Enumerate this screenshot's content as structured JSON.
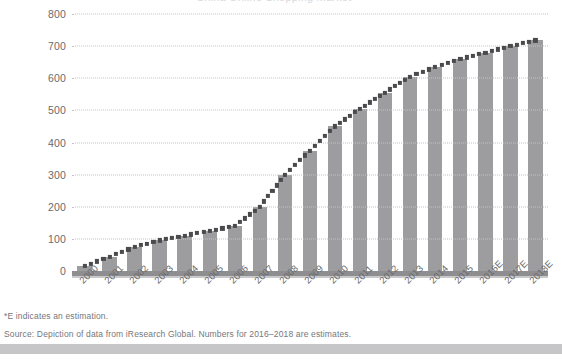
{
  "title_sliver": "China Online Shopping Market",
  "chart_data": {
    "type": "bar",
    "title": "China Online Shopping Market",
    "xlabel": "",
    "ylabel": "",
    "ylim": [
      0,
      800
    ],
    "ytick_labels": [
      "800",
      "700",
      "600",
      "500",
      "400",
      "300",
      "200",
      "100",
      "0"
    ],
    "yticks": [
      800,
      700,
      600,
      500,
      400,
      300,
      200,
      100,
      0
    ],
    "grid": true,
    "legend": "none",
    "categories": [
      "2000",
      "2001",
      "2002",
      "2003",
      "2004",
      "2005",
      "2006",
      "2007",
      "2008",
      "2009",
      "2010",
      "2011",
      "2012",
      "2013",
      "2014",
      "2015",
      "2016E",
      "2017E",
      "2018E"
    ],
    "values": [
      15,
      45,
      75,
      95,
      110,
      125,
      140,
      200,
      300,
      375,
      450,
      505,
      555,
      605,
      635,
      660,
      680,
      700,
      718
    ],
    "series": [
      {
        "name": "Market size",
        "type": "bar",
        "values": [
          15,
          45,
          75,
          95,
          110,
          125,
          140,
          200,
          300,
          375,
          450,
          505,
          555,
          605,
          635,
          660,
          680,
          700,
          718
        ]
      },
      {
        "name": "Trend",
        "type": "dotted-overlay",
        "values": [
          15,
          45,
          75,
          95,
          110,
          125,
          140,
          200,
          300,
          375,
          450,
          505,
          555,
          605,
          635,
          660,
          680,
          700,
          718
        ]
      }
    ],
    "bar_color": "#9d9d9f",
    "trend_color": "#4a4a4c",
    "gridline_color": "#c4c4c6",
    "axis_color": "#8e8e90"
  },
  "notes": [
    "*E indicates an estimation.",
    "Source: Depiction of data from iResearch Global. Numbers for 2016–2018 are estimates."
  ],
  "accent_color": "#c6c6c8"
}
